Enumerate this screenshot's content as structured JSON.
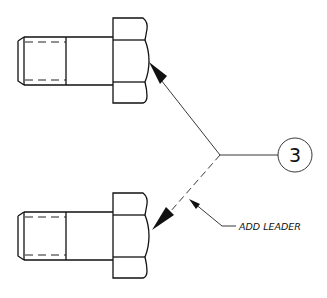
{
  "diagram": {
    "type": "engineering-drawing",
    "balloon": {
      "label": "3",
      "cx": 295,
      "cy": 155,
      "r": 17
    },
    "annotation": {
      "text": "ADD LEADER"
    },
    "parts": [
      {
        "name": "top-bolt",
        "offset_y": 0
      },
      {
        "name": "bottom-bolt",
        "offset_y": 175
      }
    ],
    "colors": {
      "line": "#111111",
      "background": "#ffffff"
    }
  }
}
